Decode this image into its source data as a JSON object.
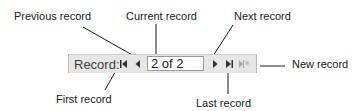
{
  "callouts": {
    "previous": "Previous record",
    "current": "Current record",
    "next": "Next record",
    "new": "New record",
    "first": "First record",
    "last": "Last record"
  },
  "navigator": {
    "label": "Record:",
    "current_value": "2 of 2",
    "buttons": [
      {
        "name": "first-record",
        "icon": "skip-to-first-icon",
        "enabled": true
      },
      {
        "name": "previous-record",
        "icon": "triangle-left-icon",
        "enabled": true
      },
      {
        "name": "next-record",
        "icon": "triangle-right-icon",
        "enabled": true
      },
      {
        "name": "last-record",
        "icon": "skip-to-last-icon",
        "enabled": true
      },
      {
        "name": "new-record",
        "icon": "new-record-asterisk-icon",
        "enabled": false
      }
    ]
  },
  "colors": {
    "toolbar_bg": "#e6e6e6",
    "icon": "#333333",
    "icon_disabled": "#a8a8a8",
    "callout_line": "#1a1a1a"
  }
}
